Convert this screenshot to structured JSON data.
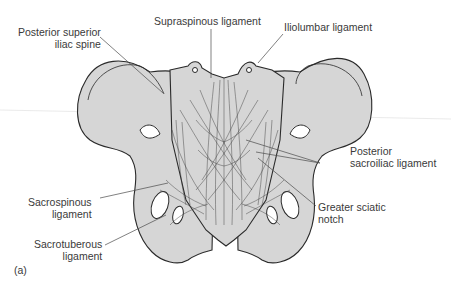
{
  "figure": {
    "panel_label": "(a)",
    "colors": {
      "bone_fill": "#d6d6d6",
      "outline": "#2a2a2a",
      "leader_line": "#4a4a4a",
      "text": "#3a3a3a",
      "background": "#ffffff"
    }
  },
  "labels": {
    "posterior_superior_iliac_spine": {
      "line1": "Posterior superior",
      "line2": "iliac spine"
    },
    "supraspinous_ligament": {
      "line1": "Supraspinous ligament"
    },
    "iliolumbar_ligament": {
      "line1": "Iliolumbar ligament"
    },
    "posterior_sacroiliac_ligament": {
      "line1": "Posterior",
      "line2": "sacroiliac ligament"
    },
    "sacrospinous_ligament": {
      "line1": "Sacrospinous",
      "line2": "ligament"
    },
    "greater_sciatic_notch": {
      "line1": "Greater sciatic",
      "line2": "notch"
    },
    "sacrotuberous_ligament": {
      "line1": "Sacrotuberous",
      "line2": "ligament"
    }
  }
}
